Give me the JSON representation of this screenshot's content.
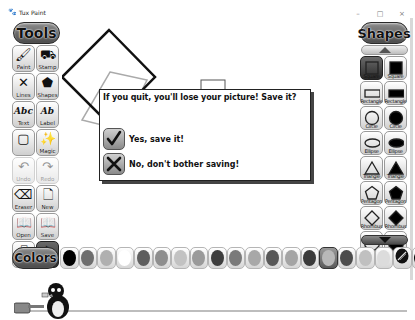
{
  "window": {
    "title": "Tux Paint",
    "controls": {
      "minimize": "–",
      "maximize": "□",
      "close": "×"
    }
  },
  "tools": {
    "header": "Tools",
    "items": [
      {
        "label": "Paint",
        "icon": "paintbrush-icon",
        "glyph": "🖌",
        "state": "normal"
      },
      {
        "label": "Stamp",
        "icon": "stamp-icon",
        "glyph": "⛟",
        "state": "normal"
      },
      {
        "label": "Lines",
        "icon": "lines-icon",
        "glyph": "✕",
        "state": "normal"
      },
      {
        "label": "Shapes",
        "icon": "pentagon-icon",
        "glyph": "⬟",
        "state": "normal"
      },
      {
        "label": "Text",
        "icon": "text-icon",
        "glyph": "Abc",
        "state": "normal"
      },
      {
        "label": "Label",
        "icon": "label-icon",
        "glyph": "Ab",
        "state": "normal"
      },
      {
        "label": "",
        "icon": "fill-icon",
        "glyph": "▢",
        "state": "normal"
      },
      {
        "label": "Magic",
        "icon": "magic-wand-icon",
        "glyph": "✨",
        "state": "normal"
      },
      {
        "label": "Undo",
        "icon": "undo-icon",
        "glyph": "↶",
        "state": "disabled"
      },
      {
        "label": "Redo",
        "icon": "redo-icon",
        "glyph": "↷",
        "state": "disabled"
      },
      {
        "label": "Eraser",
        "icon": "eraser-icon",
        "glyph": "⌫",
        "state": "normal"
      },
      {
        "label": "New",
        "icon": "new-page-icon",
        "glyph": "🗋",
        "state": "normal"
      },
      {
        "label": "Open",
        "icon": "open-book-icon",
        "glyph": "📖",
        "state": "normal"
      },
      {
        "label": "Save",
        "icon": "save-book-icon",
        "glyph": "📖",
        "state": "normal"
      },
      {
        "label": "Print",
        "icon": "printer-icon",
        "glyph": "🖶",
        "state": "normal"
      },
      {
        "label": "Quit",
        "icon": "quit-icon",
        "glyph": "✈",
        "state": "selected"
      }
    ]
  },
  "shapes": {
    "header": "Shapes",
    "items": [
      {
        "label": "Square",
        "shape": "square",
        "filled": false,
        "state": "selected"
      },
      {
        "label": "Square",
        "shape": "square",
        "filled": true,
        "state": "normal"
      },
      {
        "label": "Rectangle",
        "shape": "rectangle",
        "filled": false,
        "state": "normal"
      },
      {
        "label": "Rectangle",
        "shape": "rectangle",
        "filled": true,
        "state": "normal"
      },
      {
        "label": "Circle",
        "shape": "circle",
        "filled": false,
        "state": "normal"
      },
      {
        "label": "Circle",
        "shape": "circle",
        "filled": true,
        "state": "normal"
      },
      {
        "label": "Ellipse",
        "shape": "ellipse",
        "filled": false,
        "state": "normal"
      },
      {
        "label": "Ellipse",
        "shape": "ellipse",
        "filled": true,
        "state": "normal"
      },
      {
        "label": "Triangle",
        "shape": "triangle",
        "filled": false,
        "state": "normal"
      },
      {
        "label": "Triangle",
        "shape": "triangle",
        "filled": true,
        "state": "normal"
      },
      {
        "label": "Pentagon",
        "shape": "pentagon",
        "filled": false,
        "state": "normal"
      },
      {
        "label": "Pentagon",
        "shape": "pentagon",
        "filled": true,
        "state": "normal"
      },
      {
        "label": "Rhombus",
        "shape": "rhombus",
        "filled": false,
        "state": "normal"
      },
      {
        "label": "Rhombus",
        "shape": "rhombus",
        "filled": true,
        "state": "normal"
      },
      {
        "label": "Octagon",
        "shape": "octagon",
        "filled": false,
        "state": "normal"
      },
      {
        "label": "Octagon",
        "shape": "octagon",
        "filled": true,
        "state": "normal"
      }
    ]
  },
  "colors": {
    "header": "Colors",
    "swatches": [
      "#000000",
      "#6e6e6e",
      "#b0b0b0",
      "#ffffff",
      "#5e5e5e",
      "#8e8e8e",
      "#c2c2c2",
      "#9a9a9a",
      "#3e3e3e",
      "#7a7a7a",
      "#a8a8a8",
      "#585858",
      "#a4a4a4",
      "#3a3a3a",
      "#b8b8b8",
      "#4c4c4c",
      "#c0c0c0",
      "#dcdcdc",
      "picker",
      "#000000"
    ],
    "selected_index": 14
  },
  "dialog": {
    "message": "If you quit, you'll lose your picture! Save it?",
    "yes_label": "Yes, save it!",
    "no_label": "No, don't bother saving!"
  }
}
